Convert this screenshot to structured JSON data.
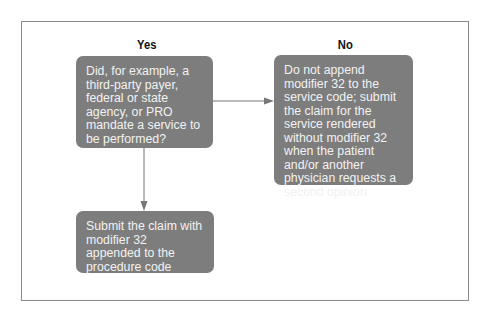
{
  "diagram": {
    "headings": {
      "yes": "Yes",
      "no": "No"
    },
    "nodes": {
      "question": "Did, for example, a third-party payer, federal or state agency, or PRO mandate a service to be performed?",
      "no_outcome": "Do not append modifier 32 to the service code; submit the claim for the service rendered without modifier 32 when the patient and/or another physician requests a second opinion",
      "yes_outcome": "Submit the claim with modifier 32 appended to the procedure code"
    },
    "edges": [
      {
        "from": "question",
        "to": "no_outcome",
        "direction": "right"
      },
      {
        "from": "question",
        "to": "yes_outcome",
        "direction": "down"
      }
    ],
    "colors": {
      "box_fill": "#7d7d7d",
      "box_text": "#f2f2f2",
      "line": "#777777",
      "frame": "#8a8a8a"
    }
  }
}
